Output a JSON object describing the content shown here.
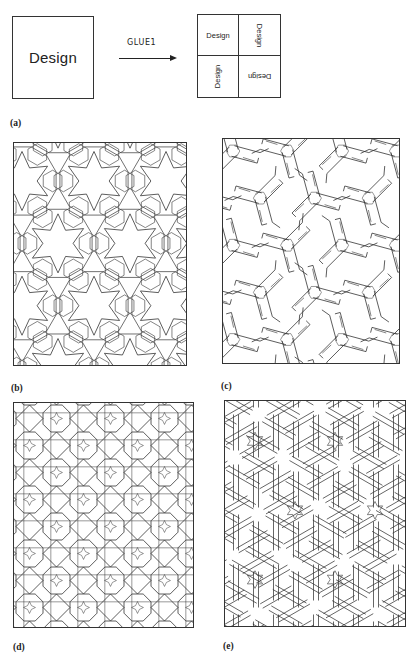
{
  "top_diagram": {
    "source_label": "Design",
    "operation_label": "GLUE1",
    "glued_cells": [
      {
        "position": "top-left",
        "label": "Design",
        "rotation_deg": 0
      },
      {
        "position": "top-right",
        "label": "Design",
        "rotation_deg": 90
      },
      {
        "position": "bottom-left",
        "label": "Design",
        "rotation_deg": -90
      },
      {
        "position": "bottom-right",
        "label": "Design",
        "rotation_deg": 180
      }
    ]
  },
  "panels": {
    "a": {
      "label": "(a)"
    },
    "b": {
      "label": "(b)",
      "pattern": "six-point-star-hexagonal",
      "box": {
        "x": 13,
        "y": 142,
        "w": 174,
        "h": 224
      },
      "cell": 36
    },
    "c": {
      "label": "(c)",
      "pattern": "pinwheel-tripod-interlace",
      "box": {
        "x": 222,
        "y": 138,
        "w": 178,
        "h": 226
      },
      "cell": 34
    },
    "d": {
      "label": "(d)",
      "pattern": "four-point-star-square",
      "box": {
        "x": 13,
        "y": 402,
        "w": 181,
        "h": 226
      },
      "cell": 27
    },
    "e": {
      "label": "(e)",
      "pattern": "interlaced-hexagonal-bands",
      "box": {
        "x": 224,
        "y": 400,
        "w": 182,
        "h": 227
      },
      "cell": 40
    }
  },
  "colors": {
    "ink": "#333333",
    "paper": "#ffffff"
  }
}
